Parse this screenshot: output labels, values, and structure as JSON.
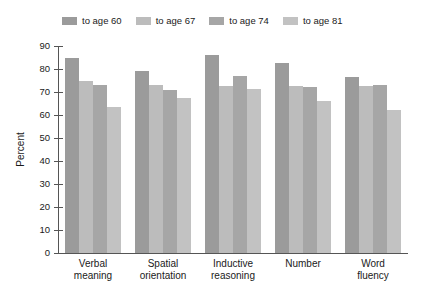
{
  "chart_data": {
    "type": "bar",
    "title": "",
    "xlabel": "",
    "ylabel": "Percent",
    "ylim": [
      0,
      90
    ],
    "ytick_step": 10,
    "yticks": [
      0,
      10,
      20,
      30,
      40,
      50,
      60,
      70,
      80,
      90
    ],
    "grid": false,
    "legend_position": "top",
    "categories": [
      "Verbal meaning",
      "Spatial orientation",
      "Inductive reasoning",
      "Number",
      "Word fluency"
    ],
    "category_lines": [
      [
        "Verbal",
        "meaning"
      ],
      [
        "Spatial",
        "orientation"
      ],
      [
        "Inductive",
        "reasoning"
      ],
      [
        "Number",
        ""
      ],
      [
        "Word",
        "fluency"
      ]
    ],
    "series": [
      {
        "name": "to age 60",
        "color": "#9b9b9b",
        "values": [
          85,
          79,
          86,
          82.5,
          76.5
        ]
      },
      {
        "name": "to age 67",
        "color": "#bcbcbc",
        "values": [
          75,
          73,
          72.5,
          72.5,
          72.5
        ]
      },
      {
        "name": "to age 74",
        "color": "#a6a6a6",
        "values": [
          73,
          71,
          77,
          72,
          73
        ]
      },
      {
        "name": "to age 81",
        "color": "#c2c2c2",
        "values": [
          63.5,
          67.5,
          71.5,
          66,
          62
        ]
      }
    ]
  },
  "axis": {
    "y_title": "Percent",
    "y_labels": [
      "90",
      "80",
      "70",
      "60",
      "50",
      "40",
      "30",
      "20",
      "10",
      "0"
    ]
  },
  "legend": {
    "entries": [
      {
        "label": "to age 60"
      },
      {
        "label": "to age 67"
      },
      {
        "label": "to age 74"
      },
      {
        "label": "to age 81"
      }
    ]
  }
}
